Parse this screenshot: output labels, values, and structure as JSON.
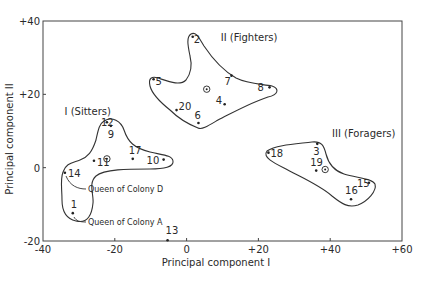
{
  "chart_data": {
    "type": "scatter",
    "title": "",
    "xlabel": "Principal component I",
    "ylabel": "Principal component II",
    "xlim": [
      -40,
      60
    ],
    "ylim": [
      -20,
      40
    ],
    "grid": false,
    "legend": null,
    "x_ticks": [
      {
        "value": -40,
        "label": "-40"
      },
      {
        "value": -20,
        "label": "-20"
      },
      {
        "value": 0,
        "label": "0"
      },
      {
        "value": 20,
        "label": "+20"
      },
      {
        "value": 40,
        "label": "+40"
      },
      {
        "value": 60,
        "label": "+60"
      }
    ],
    "y_ticks": [
      {
        "value": 40,
        "label": "+40"
      },
      {
        "value": 20,
        "label": "+20"
      },
      {
        "value": 0,
        "label": "0"
      },
      {
        "value": -20,
        "label": "-20"
      }
    ],
    "clusters": [
      {
        "name": "I (Sitters)",
        "label_pos": [
          -34,
          14.5
        ],
        "centroid": [
          -22.2,
          2.4
        ],
        "points": [
          {
            "id": "12",
            "x": -22.2,
            "y": 12.4,
            "lx": -6,
            "ly": 4
          },
          {
            "id": "9",
            "x": -21.1,
            "y": 11.4,
            "lx": -3,
            "ly": 12
          },
          {
            "id": "11",
            "x": -25.8,
            "y": 1.9,
            "lx": 3,
            "ly": 5
          },
          {
            "id": "17",
            "x": -15.0,
            "y": 2.4,
            "lx": -4,
            "ly": -5
          },
          {
            "id": "10",
            "x": -6.4,
            "y": 2.2,
            "lx": -17,
            "ly": 4
          },
          {
            "id": "14",
            "x": -33.9,
            "y": -1.4,
            "lx": 3,
            "ly": 4
          },
          {
            "id": "1",
            "x": -31.7,
            "y": -12.4,
            "lx": -2,
            "ly": -5
          }
        ]
      },
      {
        "name": "II (Fighters)",
        "label_pos": [
          9.5,
          34.5
        ],
        "centroid": [
          5.6,
          21.4
        ],
        "points": [
          {
            "id": "2",
            "x": 1.7,
            "y": 35.7,
            "lx": 1,
            "ly": 6
          },
          {
            "id": "5",
            "x": -9.2,
            "y": 24.1,
            "lx": 2,
            "ly": 6
          },
          {
            "id": "7",
            "x": 12.5,
            "y": 25.1,
            "lx": -7,
            "ly": 9
          },
          {
            "id": "8",
            "x": 23.1,
            "y": 21.9,
            "lx": -12,
            "ly": 4
          },
          {
            "id": "4",
            "x": 10.6,
            "y": 17.3,
            "lx": -9,
            "ly": 0
          },
          {
            "id": "20",
            "x": -2.8,
            "y": 15.7,
            "lx": 2,
            "ly": 0
          },
          {
            "id": "6",
            "x": 3.3,
            "y": 12.2,
            "lx": -4,
            "ly": -4
          }
        ]
      },
      {
        "name": "III (Foragers)",
        "label_pos": [
          40.5,
          8.5
        ],
        "centroid": [
          38.6,
          -0.5
        ],
        "points": [
          {
            "id": "18",
            "x": 22.8,
            "y": 4.1,
            "lx": 2,
            "ly": 4
          },
          {
            "id": "3",
            "x": 36.4,
            "y": 6.5,
            "lx": -4,
            "ly": 11
          },
          {
            "id": "19",
            "x": 36.1,
            "y": -0.8,
            "lx": -6,
            "ly": -5
          },
          {
            "id": "15",
            "x": 50.8,
            "y": -4.1,
            "lx": -12,
            "ly": 4
          },
          {
            "id": "16",
            "x": 45.8,
            "y": -8.6,
            "lx": -6,
            "ly": -5
          }
        ]
      }
    ],
    "outliers": [
      {
        "id": "13",
        "x": -5.3,
        "y": -19.8,
        "lx": -2,
        "ly": -6
      }
    ],
    "annotations": [
      {
        "text": "Queen of Colony D",
        "refers_to": "14"
      },
      {
        "text": "Queen of Colony A",
        "refers_to": "1"
      }
    ]
  }
}
